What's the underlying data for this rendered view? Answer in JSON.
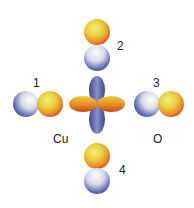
{
  "diagram": {
    "center_atom_label": "Cu",
    "ligand_atom_label": "O",
    "orbital_labels": [
      "1",
      "2",
      "3",
      "4"
    ],
    "colors": {
      "positive_lobe": "#e8a22a",
      "positive_highlight": "#f2e25a",
      "positive_edge": "#d2541c",
      "negative_lobe": "#4a5aa8",
      "negative_highlight": "#f2f2f4",
      "background": "#ffffff"
    }
  }
}
